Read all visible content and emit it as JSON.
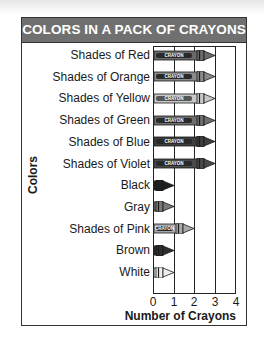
{
  "chart_data": {
    "type": "bar",
    "orientation": "horizontal",
    "style": "pictograph",
    "title": "COLORS IN A PACK OF CRAYONS",
    "xlabel": "Number of Crayons",
    "ylabel": "Colors",
    "categories": [
      "Shades of Red",
      "Shades of Orange",
      "Shades of Yellow",
      "Shades of Green",
      "Shades of Blue",
      "Shades of Violet",
      "Black",
      "Gray",
      "Shades of Pink",
      "Brown",
      "White"
    ],
    "values": [
      3,
      3,
      3,
      3,
      3,
      3,
      1,
      1,
      2,
      1,
      1
    ],
    "xlim": [
      0,
      4
    ],
    "xticks": [
      "0",
      "1",
      "2",
      "3",
      "4"
    ],
    "grid": true,
    "bar_label_text": "CRAYON"
  },
  "rows": [
    {
      "label": "Shades of Red",
      "value": 3,
      "shade": "#6a6a6a"
    },
    {
      "label": "Shades of Orange",
      "value": 3,
      "shade": "#8a8a8a"
    },
    {
      "label": "Shades of Yellow",
      "value": 3,
      "shade": "#c8c8c8"
    },
    {
      "label": "Shades of Green",
      "value": 3,
      "shade": "#6e6e6e"
    },
    {
      "label": "Shades of Blue",
      "value": 3,
      "shade": "#3e3e3e"
    },
    {
      "label": "Shades of Violet",
      "value": 3,
      "shade": "#4a4a4a"
    },
    {
      "label": "Black",
      "value": 1,
      "shade": "#1e1e1e"
    },
    {
      "label": "Gray",
      "value": 1,
      "shade": "#7a7a7a"
    },
    {
      "label": "Shades of Pink",
      "value": 2,
      "shade": "#a8a8a8"
    },
    {
      "label": "Brown",
      "value": 1,
      "shade": "#2e2e2e"
    },
    {
      "label": "White",
      "value": 1,
      "shade": "#eeeeee"
    }
  ],
  "colors": {
    "header_bg": "#707070",
    "header_text": "#ffffff",
    "border": "#333333"
  }
}
